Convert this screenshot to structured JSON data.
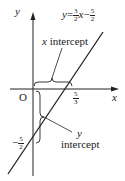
{
  "diagram": {
    "axes": {
      "x_label": "x",
      "y_label": "y",
      "origin_label": "O"
    },
    "equation": {
      "lhs": "y",
      "eq": "=",
      "coef_num": "3",
      "coef_den": "2",
      "var": "x",
      "minus": "−",
      "const_num": "5",
      "const_den": "2"
    },
    "x_intercept": {
      "label": "x intercept",
      "label_var": "x",
      "label_word": "intercept",
      "value_num": "5",
      "value_den": "3"
    },
    "y_intercept": {
      "label_var": "y",
      "label_word": "intercept",
      "value_sign": "−",
      "value_num": "5",
      "value_den": "2"
    },
    "colors": {
      "stroke": "#222222",
      "background": "#ffffff"
    }
  }
}
